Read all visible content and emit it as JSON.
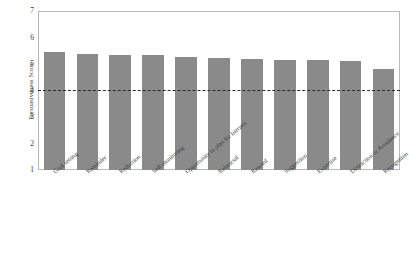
{
  "chart_data": {
    "type": "bar",
    "title": "",
    "xlabel": "",
    "ylabel": "Persuasiveness Score",
    "ylim": [
      1,
      7
    ],
    "yticks": [
      1,
      2,
      3,
      4,
      5,
      6,
      7
    ],
    "grid": false,
    "legend": null,
    "bar_color": "#8a8a8a",
    "reference_line": {
      "value": 4,
      "style": "dashed",
      "color": "#2b2b2b"
    },
    "categories": [
      "Goal setting",
      "Reminder",
      "Reduction",
      "Self-monitoring",
      "Opportunity to plan for barriers",
      "Rehearsal",
      "Reward",
      "Suggestion",
      "Expertise",
      "Distraction or Avoidance",
      "Recognition"
    ],
    "values": [
      5.45,
      5.38,
      5.34,
      5.33,
      5.27,
      5.22,
      5.19,
      5.16,
      5.14,
      5.12,
      4.8
    ]
  }
}
